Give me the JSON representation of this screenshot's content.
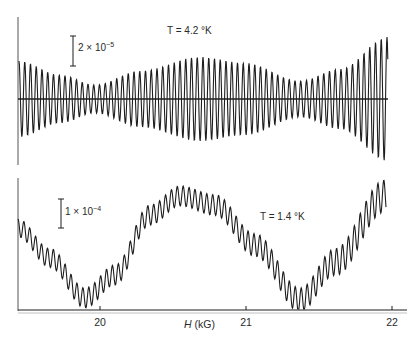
{
  "chart_data": [
    {
      "type": "line",
      "panel": "top",
      "title": "T = 4.2 °K",
      "annotation_label": "T = 4.2 °K",
      "scale_bar": {
        "label": "2 × 10⁻⁵",
        "base": "2 × 10",
        "exp": "−5"
      },
      "xlabel": "H (kG)",
      "ylabel": "",
      "x_range": [
        19.4,
        22.0
      ],
      "description": "Fast oscillations about a zero baseline with a beat (modulated) envelope",
      "envelope_minima_H": [
        20.0,
        21.35
      ],
      "envelope_maxima_H": [
        20.65,
        22.0
      ],
      "envelope_amplitude_rel": {
        "start": 0.63,
        "min1": 0.22,
        "max1": 0.7,
        "min2": 0.33,
        "end": 1.0
      },
      "grid": false
    },
    {
      "type": "line",
      "panel": "bottom",
      "title": "T = 1.4 °K",
      "annotation_label": "T = 1.4 °K",
      "scale_bar": {
        "label": "1 × 10⁻⁴",
        "base": "1 × 10",
        "exp": "−4"
      },
      "xlabel": "H (kG)",
      "ylabel": "",
      "x_range": [
        19.4,
        22.0
      ],
      "description": "Fast oscillations superimposed on a slow large-amplitude oscillation",
      "slow_minima_H": [
        19.95,
        21.35
      ],
      "slow_maxima_H": [
        20.6,
        22.0
      ],
      "grid": false
    }
  ],
  "axis": {
    "xlabel_italic": "H",
    "xlabel_unit": " (kG)",
    "ticks": [
      {
        "value": "20",
        "x": 100
      },
      {
        "value": "21",
        "x": 246
      },
      {
        "value": "22",
        "x": 392
      }
    ]
  },
  "colors": {
    "ink": "#1e1e1e",
    "background": "#ffffff"
  }
}
